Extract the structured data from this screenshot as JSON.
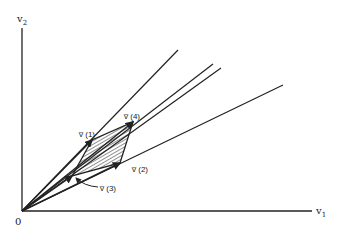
{
  "diagram": {
    "axes": {
      "x_label": "v",
      "x_sub": "1",
      "y_label": "v",
      "y_sub": "2",
      "origin_label": "0"
    },
    "vertices": [
      {
        "id": "v1",
        "label": "v̅ (1)"
      },
      {
        "id": "v2",
        "label": "v̅ (2)"
      },
      {
        "id": "v3",
        "label": "v̅ (3)"
      },
      {
        "id": "v4",
        "label": "v̅ (4)"
      }
    ],
    "region": "shaded quadrilateral (hatched) spanned by vectors v(1)..v(4)",
    "rays_from_origin": 4,
    "colors": {
      "ink": "#222222",
      "background": "#ffffff"
    }
  }
}
